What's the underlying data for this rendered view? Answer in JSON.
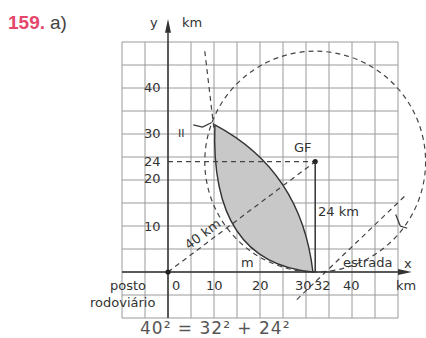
{
  "exercise": {
    "number": "159.",
    "part": "a)"
  },
  "axes": {
    "y_label": "y",
    "y_unit": "km",
    "x_label": "x",
    "x_unit": "km",
    "x_ticks": [
      "0",
      "10",
      "20",
      "30",
      "32",
      "40"
    ],
    "y_ticks": [
      "10",
      "20",
      "24",
      "30",
      "40"
    ],
    "x_range_km": [
      -10,
      50
    ],
    "y_range_km": [
      -10,
      50
    ],
    "grid_step_km": 5
  },
  "labels": {
    "origin_line1": "posto",
    "origin_line2": "rodoviário",
    "road": "estrada",
    "point": "GF",
    "vertical_distance": "24 km",
    "diagonal_distance": "40 km",
    "arc_label": "m",
    "region_label": "II"
  },
  "points": {
    "origin": [
      0,
      0
    ],
    "GF": [
      32,
      24
    ]
  },
  "circle": {
    "center": [
      32,
      24
    ],
    "radius_km": 24
  },
  "colors": {
    "exercise_number": "#e4466a",
    "shaded_region": "#c8c8c8",
    "grid": "#9a9a9a",
    "ink": "#333333"
  },
  "bottom_partial_text": "40² = 32² + 24²"
}
